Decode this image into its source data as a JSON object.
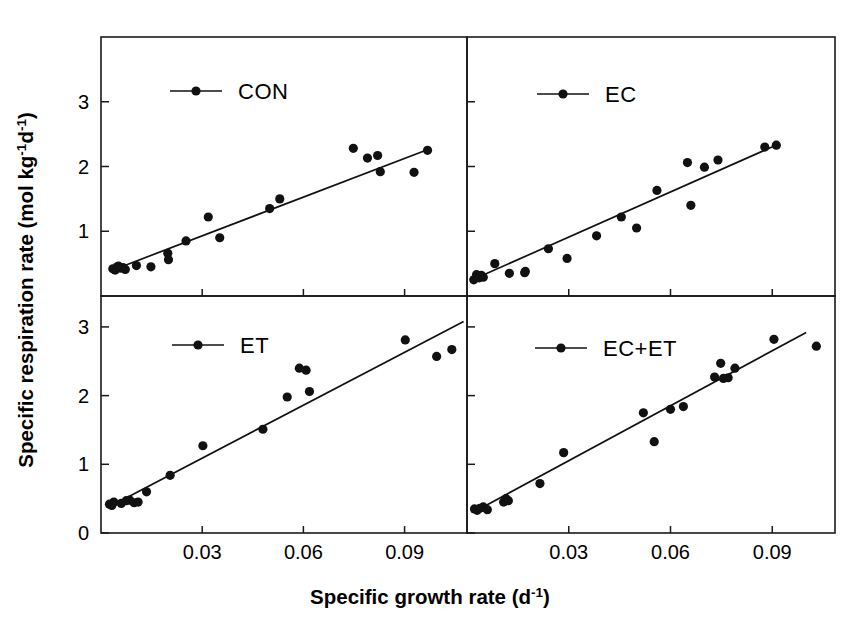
{
  "figure": {
    "xlabel_main": "Specific growth rate (d",
    "xlabel_sup": "-1",
    "xlabel_close": ")",
    "ylabel_a": "Specific respiration rate (mol kg",
    "ylabel_sup1": "-1",
    "ylabel_b": "d",
    "ylabel_sup2": "-1",
    "ylabel_close": ")",
    "background": "#ffffff",
    "ink": "#111111"
  },
  "chart_data": [
    {
      "type": "scatter",
      "panel": "top-left",
      "title": "CON",
      "legend": "CON",
      "legend_position": "top-left-inside",
      "xlabel": "Specific growth rate (d-1)",
      "ylabel": "Specific respiration rate (mol kg-1 d-1)",
      "xlim": [
        0.0,
        0.1085
      ],
      "ylim": [
        0.0,
        4.0
      ],
      "xticks": [
        0.03,
        0.06,
        0.09
      ],
      "xticklabels": [
        "0.03",
        "0.06",
        "0.09"
      ],
      "yticks": [
        1,
        2,
        3,
        4
      ],
      "yticklabels": [
        "1",
        "2",
        "3",
        "4"
      ],
      "grid": false,
      "x": [
        0.0035,
        0.0042,
        0.0048,
        0.0052,
        0.0058,
        0.0065,
        0.0072,
        0.0105,
        0.0148,
        0.0198,
        0.02,
        0.0252,
        0.0318,
        0.0352,
        0.05,
        0.053,
        0.0748,
        0.079,
        0.082,
        0.0828,
        0.0928,
        0.0968
      ],
      "y": [
        0.42,
        0.4,
        0.45,
        0.46,
        0.43,
        0.44,
        0.41,
        0.47,
        0.45,
        0.66,
        0.56,
        0.85,
        1.22,
        0.9,
        1.35,
        1.5,
        2.28,
        2.13,
        2.17,
        1.92,
        1.91,
        2.25
      ],
      "fit_line": {
        "x0": 0.0032,
        "y0": 0.395,
        "x1": 0.0975,
        "y1": 2.275
      }
    },
    {
      "type": "scatter",
      "panel": "top-right",
      "title": "EC",
      "legend": "EC",
      "legend_position": "top-left-inside",
      "xlabel": "Specific growth rate (d-1)",
      "ylabel": "Specific respiration rate (mol kg-1 d-1)",
      "xlim": [
        0.0,
        0.1085
      ],
      "ylim": [
        0.0,
        4.0
      ],
      "xticks": [
        0.03,
        0.06,
        0.09
      ],
      "xticklabels": [
        "0.03",
        "0.06",
        "0.09"
      ],
      "yticks": [
        1,
        2,
        3,
        4
      ],
      "yticklabels": [
        "1",
        "2",
        "3",
        "4"
      ],
      "grid": false,
      "x": [
        0.002,
        0.0028,
        0.0032,
        0.0036,
        0.0042,
        0.0048,
        0.0082,
        0.0125,
        0.017,
        0.0172,
        0.024,
        0.0295,
        0.0382,
        0.0455,
        0.05,
        0.056,
        0.065,
        0.066,
        0.07,
        0.074,
        0.0878,
        0.0912
      ],
      "y": [
        0.25,
        0.33,
        0.3,
        0.28,
        0.32,
        0.29,
        0.5,
        0.35,
        0.36,
        0.38,
        0.73,
        0.58,
        0.93,
        1.22,
        1.05,
        1.63,
        2.06,
        1.4,
        1.99,
        2.1,
        2.3,
        2.33
      ],
      "fit_line": {
        "x0": 0.0018,
        "y0": 0.255,
        "x1": 0.0918,
        "y1": 2.345
      }
    },
    {
      "type": "scatter",
      "panel": "bottom-left",
      "title": "ET",
      "legend": "ET",
      "legend_position": "top-left-inside",
      "xlabel": "Specific growth rate (d-1)",
      "ylabel": "Specific respiration rate (mol kg-1 d-1)",
      "xlim": [
        0.0,
        0.1085
      ],
      "ylim": [
        0.0,
        3.45
      ],
      "xticks": [
        0.03,
        0.06,
        0.09
      ],
      "xticklabels": [
        "0.03",
        "0.06",
        "0.09"
      ],
      "yticks": [
        0,
        1,
        2,
        3
      ],
      "yticklabels": [
        "0",
        "1",
        "2",
        "3"
      ],
      "grid": false,
      "x": [
        0.0025,
        0.0032,
        0.0038,
        0.006,
        0.0075,
        0.0085,
        0.0098,
        0.011,
        0.0135,
        0.0205,
        0.0302,
        0.048,
        0.0552,
        0.0588,
        0.0608,
        0.0618,
        0.0902,
        0.0995,
        0.104
      ],
      "y": [
        0.42,
        0.4,
        0.45,
        0.43,
        0.47,
        0.48,
        0.44,
        0.45,
        0.6,
        0.84,
        1.27,
        1.51,
        1.98,
        2.4,
        2.37,
        2.06,
        2.81,
        2.57,
        2.67
      ],
      "fit_line": {
        "x0": 0.0022,
        "y0": 0.375,
        "x1": 0.1075,
        "y1": 3.08
      }
    },
    {
      "type": "scatter",
      "panel": "bottom-right",
      "title": "EC+ET",
      "legend": "EC+ET",
      "legend_position": "top-left-inside",
      "xlabel": "Specific growth rate (d-1)",
      "ylabel": "Specific respiration rate (mol kg-1 d-1)",
      "xlim": [
        0.0,
        0.1085
      ],
      "ylim": [
        0.0,
        3.45
      ],
      "xticks": [
        0.03,
        0.06,
        0.09
      ],
      "xticklabels": [
        "0.03",
        "0.06",
        "0.09"
      ],
      "yticks": [
        0,
        1,
        2,
        3
      ],
      "yticklabels": [
        "0",
        "1",
        "2",
        "3"
      ],
      "grid": false,
      "x": [
        0.0022,
        0.003,
        0.0038,
        0.0048,
        0.006,
        0.0108,
        0.0115,
        0.0122,
        0.0215,
        0.0285,
        0.052,
        0.0552,
        0.06,
        0.0638,
        0.073,
        0.0748,
        0.0756,
        0.077,
        0.079,
        0.0905,
        0.103
      ],
      "y": [
        0.35,
        0.33,
        0.36,
        0.38,
        0.34,
        0.45,
        0.5,
        0.47,
        0.72,
        1.17,
        1.75,
        1.33,
        1.8,
        1.84,
        2.27,
        2.47,
        2.25,
        2.26,
        2.4,
        2.82,
        2.72
      ],
      "fit_line": {
        "x0": 0.002,
        "y0": 0.305,
        "x1": 0.1,
        "y1": 2.92
      }
    }
  ]
}
